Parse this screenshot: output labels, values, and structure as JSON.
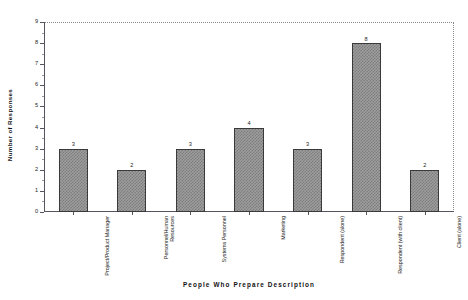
{
  "chart_data": {
    "type": "bar",
    "title": "",
    "xlabel": "People  Who  Prepare  Description",
    "ylabel": "Number of Responses",
    "categories": [
      "Project/Product Manager",
      "Personnel/Human Resources",
      "Systems Personnel",
      "Marketing",
      "Respondent (alone)",
      "Respondent (with client)",
      "Client (alone)"
    ],
    "values": [
      3,
      2,
      3,
      4,
      3,
      8,
      2
    ],
    "value_labels": [
      "3",
      "2",
      "3",
      "4",
      "3",
      "8",
      "2"
    ],
    "ylim": [
      0,
      9
    ],
    "yticks": [
      0,
      1,
      2,
      3,
      4,
      5,
      6,
      7,
      8,
      9
    ],
    "ytick_labels": [
      "0",
      "1",
      "2",
      "3",
      "4",
      "5",
      "6",
      "7",
      "8",
      "9"
    ],
    "grid": false,
    "legend": null,
    "bar_fill": "#9d9d9d",
    "bar_hatch": "checkered",
    "bar_edge_color": "#3a3a3a",
    "frame_color": "#55555f",
    "background": "#ffffff"
  }
}
